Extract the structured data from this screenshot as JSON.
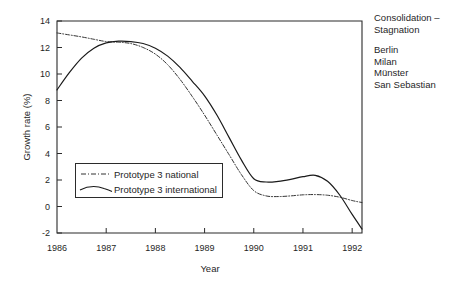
{
  "chart_data": {
    "type": "line",
    "title": "",
    "xlabel": "Year",
    "ylabel": "Growth rate (%)",
    "xlim": [
      1986,
      1992.2
    ],
    "ylim": [
      -2,
      14
    ],
    "xticks": [
      1986,
      1987,
      1988,
      1989,
      1990,
      1991,
      1992
    ],
    "xticklabels": [
      "1986",
      "1987",
      "1988",
      "1989",
      "1990",
      "1991",
      "1992"
    ],
    "yticks": [
      -2,
      0,
      2,
      4,
      6,
      8,
      10,
      12,
      14
    ],
    "yticklabels": [
      "-2",
      "0",
      "2",
      "4",
      "6",
      "8",
      "10",
      "12",
      "14"
    ],
    "grid": false,
    "legend_position": "center-left",
    "series": [
      {
        "name": "Prototype 3 national",
        "style": "dash-dot",
        "color": "#333333",
        "x": [
          1986.0,
          1986.25,
          1986.5,
          1986.75,
          1987.0,
          1987.25,
          1987.5,
          1987.75,
          1988.0,
          1988.25,
          1988.5,
          1988.75,
          1989.0,
          1989.25,
          1989.5,
          1989.75,
          1990.0,
          1990.25,
          1990.5,
          1990.75,
          1991.0,
          1991.25,
          1991.5,
          1991.75,
          1992.0,
          1992.2
        ],
        "y": [
          13.1,
          12.95,
          12.8,
          12.62,
          12.45,
          12.4,
          12.3,
          12.0,
          11.5,
          10.7,
          9.6,
          8.3,
          6.9,
          5.4,
          3.9,
          2.4,
          1.2,
          0.8,
          0.75,
          0.8,
          0.88,
          0.9,
          0.85,
          0.7,
          0.45,
          0.3
        ]
      },
      {
        "name": "Prototype 3 international",
        "style": "solid",
        "color": "#1a1a1a",
        "x": [
          1986.0,
          1986.25,
          1986.5,
          1986.75,
          1987.0,
          1987.25,
          1987.5,
          1987.75,
          1988.0,
          1988.25,
          1988.5,
          1988.75,
          1989.0,
          1989.25,
          1989.5,
          1989.75,
          1990.0,
          1990.25,
          1990.5,
          1990.75,
          1991.0,
          1991.25,
          1991.5,
          1991.75,
          1992.0,
          1992.2
        ],
        "y": [
          8.8,
          10.1,
          11.2,
          11.95,
          12.35,
          12.48,
          12.45,
          12.3,
          11.95,
          11.35,
          10.5,
          9.45,
          8.35,
          6.9,
          5.2,
          3.5,
          2.1,
          1.85,
          1.9,
          2.05,
          2.25,
          2.35,
          1.9,
          0.85,
          -0.6,
          -1.7
        ]
      }
    ],
    "annotations": {
      "heading": [
        "Consolidation –",
        "Stagnation"
      ],
      "cities": [
        "Berlin",
        "Milan",
        "Münster",
        "San Sebastian"
      ]
    }
  },
  "legend": {
    "items": [
      {
        "label": "Prototype 3 national"
      },
      {
        "label": "Prototype 3 international"
      }
    ]
  }
}
